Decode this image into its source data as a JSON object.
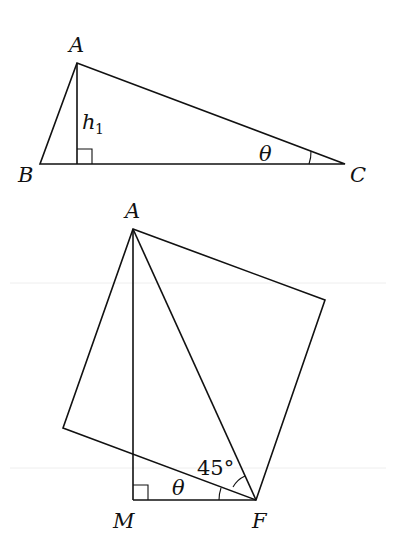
{
  "figure_top": {
    "labels": {
      "A": "A",
      "B": "B",
      "C": "C",
      "h": "h",
      "h_sub": "1",
      "theta": "θ"
    }
  },
  "figure_bottom": {
    "labels": {
      "A": "A",
      "M": "M",
      "F": "F",
      "theta": "θ",
      "angle": "45°"
    }
  }
}
